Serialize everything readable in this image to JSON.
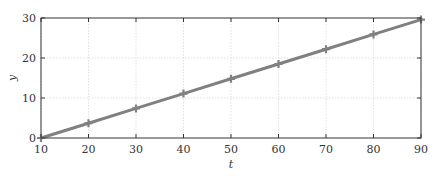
{
  "chart_data": {
    "type": "line",
    "title": "",
    "xlabel": "t",
    "ylabel": "y",
    "xlim": [
      10,
      90
    ],
    "ylim": [
      0,
      30
    ],
    "xticks": [
      10,
      20,
      30,
      40,
      50,
      60,
      70,
      80,
      90
    ],
    "yticks": [
      0,
      10,
      20,
      30
    ],
    "grid": true,
    "legend": null,
    "series": [
      {
        "name": "y",
        "marker": "+",
        "color": "#808080",
        "x": [
          10,
          20,
          30,
          40,
          50,
          60,
          70,
          80,
          90
        ],
        "values": [
          0,
          3.7,
          7.4,
          11.1,
          14.8,
          18.5,
          22.2,
          25.9,
          29.6
        ]
      }
    ]
  },
  "labels": {
    "x_axis": "t",
    "y_axis": "y"
  }
}
